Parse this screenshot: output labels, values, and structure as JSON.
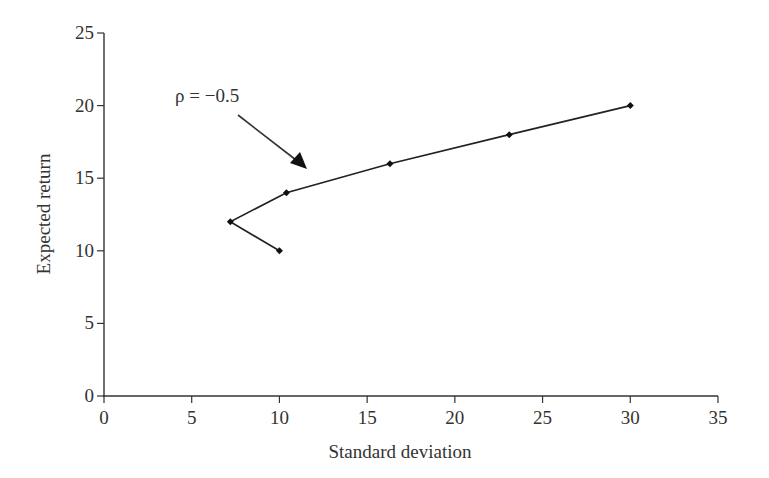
{
  "chart_data": {
    "type": "line",
    "title": "",
    "xlabel": "Standard deviation",
    "ylabel": "Expected return",
    "xlim": [
      0,
      35
    ],
    "ylim": [
      0,
      25
    ],
    "xticks": [
      0,
      5,
      10,
      15,
      20,
      25,
      30,
      35
    ],
    "yticks": [
      0,
      5,
      10,
      15,
      20,
      25
    ],
    "grid": false,
    "legend": null,
    "series": [
      {
        "name": "rho = -0.5",
        "marker": "diamond",
        "color": "#222222",
        "points": [
          {
            "x": 10.0,
            "y": 10
          },
          {
            "x": 7.2,
            "y": 12
          },
          {
            "x": 10.4,
            "y": 14
          },
          {
            "x": 16.3,
            "y": 16
          },
          {
            "x": 23.1,
            "y": 18
          },
          {
            "x": 30.0,
            "y": 20
          }
        ]
      }
    ],
    "annotations": [
      {
        "text": "ρ = −0.5",
        "arrow_to": {
          "x": 11.5,
          "y": 15.6
        }
      }
    ]
  }
}
